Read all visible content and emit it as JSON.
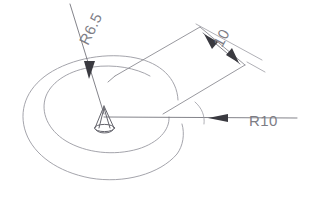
{
  "drawing": {
    "title": "Arc slot feature with radial arm",
    "background_color": "#ffffff",
    "line_color": "#8c8c93",
    "dimension_color": "#6d6d75",
    "text_color": "#7d7d85",
    "dimensions": [
      {
        "id": "inner-radius",
        "label": "R6.5",
        "kind": "radius",
        "value": 6.5,
        "prefix": "R",
        "rotation_deg": -64,
        "text_x": 88,
        "text_y": 46,
        "leader_from": {
          "x": 70,
          "y": 4
        },
        "leader_to": {
          "x": 104,
          "y": 116
        },
        "arrow_at": {
          "x": 89,
          "y": 66
        }
      },
      {
        "id": "arm-width",
        "label": "10",
        "kind": "linear",
        "value": 10,
        "prefix": "",
        "rotation_deg": -62,
        "text_x": 222,
        "text_y": 48,
        "arrow_a": {
          "x": 206,
          "y": 35
        },
        "arrow_b": {
          "x": 237,
          "y": 62
        }
      },
      {
        "id": "outer-radius",
        "label": "R10",
        "kind": "radius",
        "value": 10,
        "prefix": "R",
        "rotation_deg": 0,
        "text_x": 249,
        "text_y": 126,
        "leader_from": {
          "x": 104,
          "y": 117
        },
        "leader_to": {
          "x": 297,
          "y": 118
        },
        "arrow_at": {
          "x": 215,
          "y": 118
        }
      }
    ],
    "features": [
      {
        "id": "outer-arc",
        "kind": "arc",
        "label": "outer-arc",
        "radius_px": 75
      },
      {
        "id": "inner-arc",
        "kind": "arc",
        "label": "inner-arc",
        "radius_px": 48
      },
      {
        "id": "radial-arm",
        "kind": "band",
        "label": "radial-arm"
      },
      {
        "id": "center-hub",
        "kind": "cone",
        "label": "center-hub"
      }
    ],
    "center": {
      "x": 104,
      "y": 117
    }
  }
}
